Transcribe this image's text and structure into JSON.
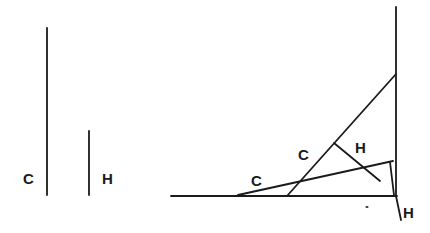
{
  "diagram": {
    "stroke_color": "#1a1a1a",
    "background_color": "#ffffff",
    "reference": {
      "c_segment": {
        "label": "C",
        "x1": 47,
        "y1": 28,
        "x2": 47,
        "y2": 195
      },
      "h_segment": {
        "label": "H",
        "x1": 89,
        "y1": 131,
        "x2": 89,
        "y2": 195
      },
      "c_label": {
        "text": "C",
        "x": 23,
        "y": 184
      },
      "h_label": {
        "text": "H",
        "x": 102,
        "y": 184
      }
    },
    "construction": {
      "baseline": {
        "x1": 171,
        "y1": 196,
        "x2": 397,
        "y2": 196
      },
      "vertical_axis": {
        "x1": 396,
        "y1": 7,
        "x2": 396,
        "y2": 196
      },
      "c_diagonal_steep": {
        "x1": 287,
        "y1": 196,
        "x2": 396,
        "y2": 74
      },
      "c_diagonal_shallow": {
        "x1": 238,
        "y1": 195,
        "x2": 393,
        "y2": 161
      },
      "h_perpendicular": {
        "x1": 334,
        "y1": 143,
        "x2": 380,
        "y2": 181
      },
      "h_short_vertical": {
        "x1": 390,
        "y1": 162,
        "x2": 394,
        "y2": 195
      },
      "h_tail": {
        "x1": 396,
        "y1": 196,
        "x2": 401,
        "y2": 220
      },
      "labels": [
        {
          "text": "C",
          "x": 251,
          "y": 186
        },
        {
          "text": "C",
          "x": 298,
          "y": 160
        },
        {
          "text": "H",
          "x": 355,
          "y": 153
        },
        {
          "text": "H",
          "x": 403,
          "y": 218
        }
      ],
      "mark_dot": {
        "x": 367,
        "y": 207
      }
    }
  }
}
